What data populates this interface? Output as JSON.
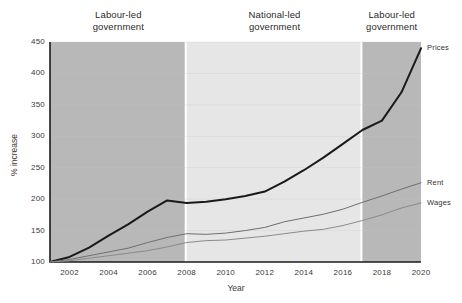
{
  "chart_data": {
    "type": "line",
    "title": "",
    "xlabel": "Year",
    "ylabel": "% increase",
    "xlim": [
      2001,
      2020
    ],
    "ylim": [
      100,
      450
    ],
    "grid": true,
    "legend_position": "right-inline",
    "x": [
      2001,
      2002,
      2003,
      2004,
      2005,
      2006,
      2007,
      2008,
      2009,
      2010,
      2011,
      2012,
      2013,
      2014,
      2015,
      2016,
      2017,
      2018,
      2019,
      2020
    ],
    "xticks": [
      "2002",
      "2004",
      "2006",
      "2008",
      "2010",
      "2012",
      "2014",
      "2016",
      "2018",
      "2020"
    ],
    "yticks": [
      "100",
      "150",
      "200",
      "250",
      "300",
      "350",
      "400",
      "450"
    ],
    "series": [
      {
        "name": "Prices",
        "color": "#1a1a1a",
        "values": [
          100,
          108,
          123,
          142,
          160,
          180,
          198,
          194,
          196,
          200,
          205,
          212,
          228,
          246,
          266,
          288,
          310,
          325,
          370,
          440
        ]
      },
      {
        "name": "Rent",
        "color": "#6e6e6e",
        "values": [
          100,
          104,
          110,
          116,
          122,
          131,
          139,
          145,
          144,
          146,
          150,
          155,
          164,
          170,
          176,
          184,
          195,
          205,
          216,
          226
        ]
      },
      {
        "name": "Wages",
        "color": "#8a8a8a",
        "values": [
          100,
          102,
          106,
          110,
          114,
          118,
          124,
          131,
          134,
          135,
          138,
          141,
          145,
          149,
          152,
          158,
          166,
          175,
          186,
          194
        ]
      }
    ],
    "bands": [
      {
        "label": "Labour-led\ngovernment",
        "start": 2001,
        "end": 2008,
        "color": "#b8b8b8"
      },
      {
        "label": "National-led\ngovernment",
        "start": 2008,
        "end": 2017,
        "color": "#e6e6e6"
      },
      {
        "label": "Labour-led\ngovernment",
        "start": 2017,
        "end": 2020,
        "color": "#b8b8b8"
      }
    ]
  }
}
